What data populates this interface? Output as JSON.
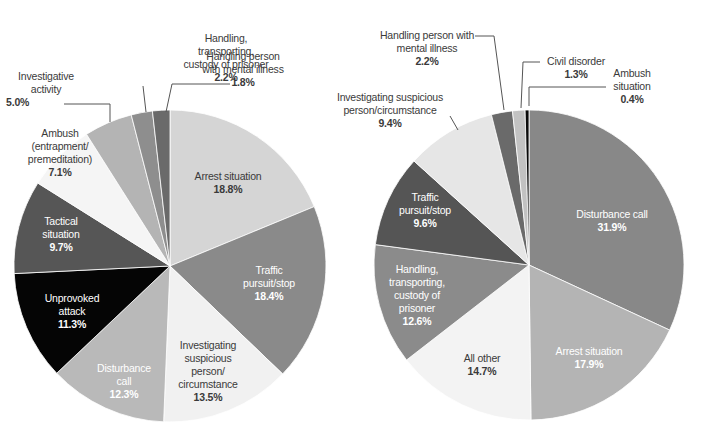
{
  "chart_data": [
    {
      "type": "pie",
      "title": "",
      "center": [
        170,
        266
      ],
      "radius": 156,
      "start_angle_deg": 0,
      "direction": "clockwise",
      "slices": [
        {
          "label": "Arrest situation",
          "value": 18.8,
          "color": "#d5d5d5"
        },
        {
          "label": "Traffic pursuit/stop",
          "value": 18.4,
          "color": "#8a8a8a"
        },
        {
          "label": "Investigating suspicious person/circumstance",
          "value": 13.5,
          "color": "#f1f1f1"
        },
        {
          "label": "Disturbance call",
          "value": 12.3,
          "color": "#b9b9b9"
        },
        {
          "label": "Unprovoked attack",
          "value": 11.3,
          "color": "#050505"
        },
        {
          "label": "Tactical situation",
          "value": 9.7,
          "color": "#565656"
        },
        {
          "label": "Ambush (entrapment/premeditation)",
          "value": 7.1,
          "color": "#f5f5f5"
        },
        {
          "label": "Investigative activity",
          "value": 5.0,
          "color": "#b4b4b4"
        },
        {
          "label": "Handling, transporting, custody of prisoner",
          "value": 2.2,
          "color": "#8e8e8e"
        },
        {
          "label": "Handling person with mental illness",
          "value": 1.8,
          "color": "#6a6a6a"
        }
      ]
    },
    {
      "type": "pie",
      "title": "",
      "center": [
        529,
        265
      ],
      "radius": 155,
      "start_angle_deg": 0,
      "direction": "clockwise",
      "slices": [
        {
          "label": "Disturbance call",
          "value": 31.9,
          "color": "#888888"
        },
        {
          "label": "Arrest situation",
          "value": 17.9,
          "color": "#b4b4b4"
        },
        {
          "label": "All other",
          "value": 14.7,
          "color": "#f3f3f3"
        },
        {
          "label": "Handling, transporting, custody of prisoner",
          "value": 12.6,
          "color": "#8b8b8b"
        },
        {
          "label": "Traffic pursuit/stop",
          "value": 9.6,
          "color": "#555555"
        },
        {
          "label": "Investigating suspicious person/circumstance",
          "value": 9.4,
          "color": "#e6e6e6"
        },
        {
          "label": "Handling person with mental illness",
          "value": 2.2,
          "color": "#6a6a6a"
        },
        {
          "label": "Civil disorder",
          "value": 1.3,
          "color": "#c2c2c2"
        },
        {
          "label": "Ambush situation",
          "value": 0.4,
          "color": "#0a0a0a"
        }
      ]
    }
  ],
  "labels": {
    "left": {
      "arrest": {
        "name": "Arrest situation",
        "pct": "18.8%"
      },
      "traffic": {
        "name1": "Traffic",
        "name2": "pursuit/stop",
        "pct": "18.4%"
      },
      "investigating": {
        "name1": "Investigating",
        "name2": "suspicious",
        "name3": "person/",
        "name4": "circumstance",
        "pct": "13.5%"
      },
      "disturbance": {
        "name1": "Disturbance",
        "name2": "call",
        "pct": "12.3%"
      },
      "unprovoked": {
        "name1": "Unprovoked",
        "name2": "attack",
        "pct": "11.3%"
      },
      "tactical": {
        "name1": "Tactical",
        "name2": "situation",
        "pct": "9.7%"
      },
      "ambush": {
        "name1": "Ambush",
        "name2": "(entrapment/",
        "name3": "premeditation)",
        "pct": "7.1%"
      },
      "investigative": {
        "name1": "Investigative",
        "name2": "activity",
        "pct": "5.0%"
      },
      "prisoner": {
        "name1": "Handling,",
        "name2": "transporting,",
        "name3": "custody of prisoner",
        "pct": "2.2%"
      },
      "mental": {
        "name1": "Handling person",
        "name2": "with mental illness",
        "pct": "1.8%"
      }
    },
    "right": {
      "disturbance": {
        "name": "Disturbance call",
        "pct": "31.9%"
      },
      "arrest": {
        "name": "Arrest situation",
        "pct": "17.9%"
      },
      "allother": {
        "name": "All other",
        "pct": "14.7%"
      },
      "prisoner": {
        "name1": "Handling,",
        "name2": "transporting,",
        "name3": "custody of",
        "name4": "prisoner",
        "pct": "12.6%"
      },
      "traffic": {
        "name1": "Traffic",
        "name2": "pursuit/stop",
        "pct": "9.6%"
      },
      "investigating": {
        "name1": "Investigating suspicious",
        "name2": "person/circumstance",
        "pct": "9.4%"
      },
      "mental": {
        "name1": "Handling person with",
        "name2": "mental illness",
        "pct": "2.2%"
      },
      "civil": {
        "name": "Civil disorder",
        "pct": "1.3%"
      },
      "ambush": {
        "name1": "Ambush",
        "name2": "situation",
        "pct": "0.4%"
      }
    }
  }
}
